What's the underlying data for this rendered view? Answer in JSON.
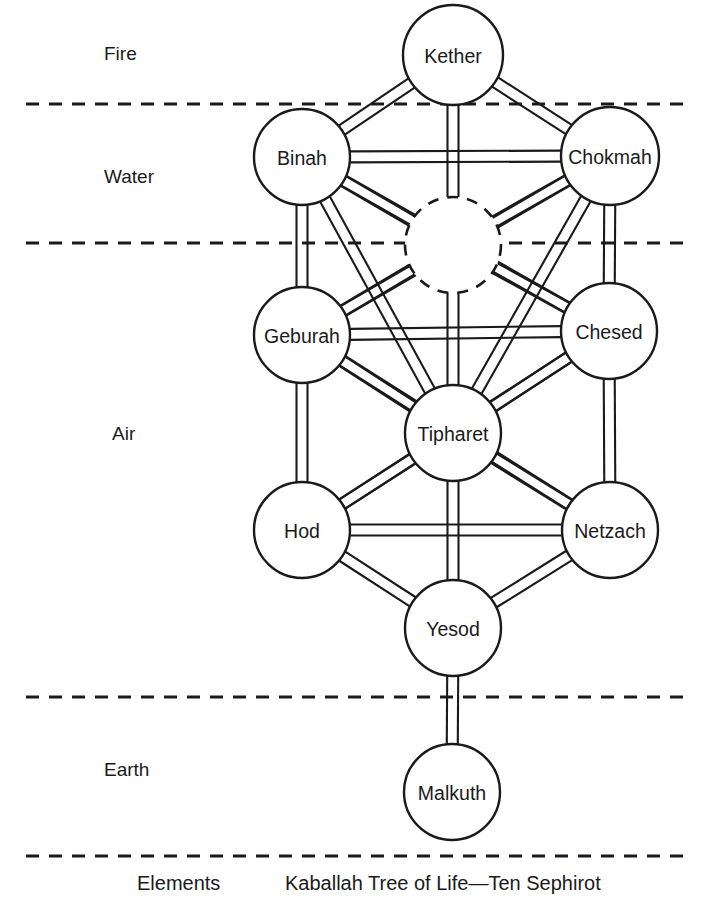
{
  "caption": {
    "title": "Kaballah Tree of Life—Ten Sephirot",
    "elements_label": "Elements"
  },
  "elements": [
    {
      "id": "fire",
      "label": "Fire",
      "x": 104,
      "y": 43
    },
    {
      "id": "water",
      "label": "Water",
      "x": 104,
      "y": 166
    },
    {
      "id": "air",
      "label": "Air",
      "x": 112,
      "y": 423
    },
    {
      "id": "earth",
      "label": "Earth",
      "x": 104,
      "y": 759
    }
  ],
  "dividers": [
    {
      "id": "fire-water",
      "y": 104,
      "x1": 26,
      "x2": 692
    },
    {
      "id": "water-air",
      "y": 243,
      "x1": 26,
      "x2": 692
    },
    {
      "id": "air-earth",
      "y": 697,
      "x1": 26,
      "x2": 692
    },
    {
      "id": "earth-bottom",
      "y": 856,
      "x1": 26,
      "x2": 692
    }
  ],
  "sephirot": [
    {
      "id": "kether",
      "label": "Kether",
      "cx": 453,
      "cy": 55,
      "r": 50
    },
    {
      "id": "binah",
      "label": "Binah",
      "cx": 302,
      "cy": 157,
      "r": 48
    },
    {
      "id": "chokmah",
      "label": "Chokmah",
      "cx": 610,
      "cy": 156,
      "r": 49
    },
    {
      "id": "geburah",
      "label": "Geburah",
      "cx": 302,
      "cy": 335,
      "r": 48
    },
    {
      "id": "chesed",
      "label": "Chesed",
      "cx": 609,
      "cy": 331,
      "r": 48
    },
    {
      "id": "tipharet",
      "label": "Tipharet",
      "cx": 453,
      "cy": 433,
      "r": 48
    },
    {
      "id": "hod",
      "label": "Hod",
      "cx": 302,
      "cy": 530,
      "r": 48
    },
    {
      "id": "netzach",
      "label": "Netzach",
      "cx": 610,
      "cy": 530,
      "r": 48
    },
    {
      "id": "yesod",
      "label": "Yesod",
      "cx": 453,
      "cy": 628,
      "r": 48
    },
    {
      "id": "malkuth",
      "label": "Malkuth",
      "cx": 452,
      "cy": 792,
      "r": 48
    }
  ],
  "daath": {
    "id": "daath",
    "cx": 453,
    "cy": 245,
    "r": 48,
    "style": "dashed",
    "label": ""
  },
  "paths": [
    {
      "from": "kether",
      "to": "binah"
    },
    {
      "from": "kether",
      "to": "chokmah"
    },
    {
      "from": "kether",
      "to": "daath"
    },
    {
      "from": "binah",
      "to": "chokmah"
    },
    {
      "from": "binah",
      "to": "daath"
    },
    {
      "from": "chokmah",
      "to": "daath"
    },
    {
      "from": "binah",
      "to": "geburah"
    },
    {
      "from": "chokmah",
      "to": "chesed"
    },
    {
      "from": "binah",
      "to": "chesed"
    },
    {
      "from": "chokmah",
      "to": "geburah"
    },
    {
      "from": "binah",
      "to": "tipharet"
    },
    {
      "from": "chokmah",
      "to": "tipharet"
    },
    {
      "from": "daath",
      "to": "geburah"
    },
    {
      "from": "daath",
      "to": "chesed"
    },
    {
      "from": "daath",
      "to": "tipharet"
    },
    {
      "from": "geburah",
      "to": "chesed"
    },
    {
      "from": "geburah",
      "to": "tipharet"
    },
    {
      "from": "chesed",
      "to": "tipharet"
    },
    {
      "from": "geburah",
      "to": "hod"
    },
    {
      "from": "chesed",
      "to": "netzach"
    },
    {
      "from": "geburah",
      "to": "netzach"
    },
    {
      "from": "chesed",
      "to": "hod"
    },
    {
      "from": "tipharet",
      "to": "hod"
    },
    {
      "from": "tipharet",
      "to": "netzach"
    },
    {
      "from": "tipharet",
      "to": "yesod"
    },
    {
      "from": "hod",
      "to": "netzach"
    },
    {
      "from": "hod",
      "to": "yesod"
    },
    {
      "from": "netzach",
      "to": "yesod"
    },
    {
      "from": "yesod",
      "to": "malkuth"
    }
  ],
  "colors": {
    "stroke": "#1a1a1a",
    "background": "#ffffff"
  }
}
